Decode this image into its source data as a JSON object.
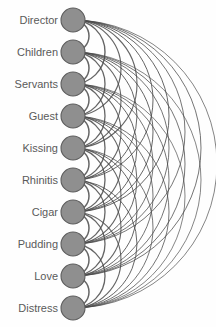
{
  "diagram": {
    "type": "arc-diagram",
    "title": "",
    "background_color": "#fefefe",
    "node_fill_color": "#8f8f8f",
    "node_stroke_color": "#5e5e5e",
    "edge_color": "#4a4a4a",
    "label_color": "#5a5a5a",
    "node_radius": 12,
    "node_center_x": 73,
    "first_node_y": 20,
    "node_spacing": 32,
    "label_right_x": 58,
    "arc_direction": "right",
    "graph_kind": "complete",
    "node_count": 10,
    "edge_count": 45,
    "nodes": [
      {
        "id": 0,
        "label": "Director"
      },
      {
        "id": 1,
        "label": "Children"
      },
      {
        "id": 2,
        "label": "Servants"
      },
      {
        "id": 3,
        "label": "Guest"
      },
      {
        "id": 4,
        "label": "Kissing"
      },
      {
        "id": 5,
        "label": "Rhinitis"
      },
      {
        "id": 6,
        "label": "Cigar"
      },
      {
        "id": 7,
        "label": "Pudding"
      },
      {
        "id": 8,
        "label": "Love"
      },
      {
        "id": 9,
        "label": "Distress"
      }
    ],
    "edges": [
      {
        "source": 0,
        "target": 1,
        "weight": 1.5
      },
      {
        "source": 0,
        "target": 2,
        "weight": 1.4
      },
      {
        "source": 0,
        "target": 3,
        "weight": 1.2
      },
      {
        "source": 0,
        "target": 4,
        "weight": 1.1
      },
      {
        "source": 0,
        "target": 5,
        "weight": 1.0
      },
      {
        "source": 0,
        "target": 6,
        "weight": 1.0
      },
      {
        "source": 0,
        "target": 7,
        "weight": 0.9
      },
      {
        "source": 0,
        "target": 8,
        "weight": 0.9
      },
      {
        "source": 0,
        "target": 9,
        "weight": 0.8
      },
      {
        "source": 1,
        "target": 2,
        "weight": 1.5
      },
      {
        "source": 1,
        "target": 3,
        "weight": 1.3
      },
      {
        "source": 1,
        "target": 4,
        "weight": 1.1
      },
      {
        "source": 1,
        "target": 5,
        "weight": 1.0
      },
      {
        "source": 1,
        "target": 6,
        "weight": 1.0
      },
      {
        "source": 1,
        "target": 7,
        "weight": 0.9
      },
      {
        "source": 1,
        "target": 8,
        "weight": 0.9
      },
      {
        "source": 1,
        "target": 9,
        "weight": 0.8
      },
      {
        "source": 2,
        "target": 3,
        "weight": 1.5
      },
      {
        "source": 2,
        "target": 4,
        "weight": 1.3
      },
      {
        "source": 2,
        "target": 5,
        "weight": 1.1
      },
      {
        "source": 2,
        "target": 6,
        "weight": 1.0
      },
      {
        "source": 2,
        "target": 7,
        "weight": 0.9
      },
      {
        "source": 2,
        "target": 8,
        "weight": 0.9
      },
      {
        "source": 2,
        "target": 9,
        "weight": 0.8
      },
      {
        "source": 3,
        "target": 4,
        "weight": 1.5
      },
      {
        "source": 3,
        "target": 5,
        "weight": 1.3
      },
      {
        "source": 3,
        "target": 6,
        "weight": 1.1
      },
      {
        "source": 3,
        "target": 7,
        "weight": 1.0
      },
      {
        "source": 3,
        "target": 8,
        "weight": 0.9
      },
      {
        "source": 3,
        "target": 9,
        "weight": 0.9
      },
      {
        "source": 4,
        "target": 5,
        "weight": 1.5
      },
      {
        "source": 4,
        "target": 6,
        "weight": 1.3
      },
      {
        "source": 4,
        "target": 7,
        "weight": 1.1
      },
      {
        "source": 4,
        "target": 8,
        "weight": 1.0
      },
      {
        "source": 4,
        "target": 9,
        "weight": 0.9
      },
      {
        "source": 5,
        "target": 6,
        "weight": 1.5
      },
      {
        "source": 5,
        "target": 7,
        "weight": 1.3
      },
      {
        "source": 5,
        "target": 8,
        "weight": 1.1
      },
      {
        "source": 5,
        "target": 9,
        "weight": 1.0
      },
      {
        "source": 6,
        "target": 7,
        "weight": 1.5
      },
      {
        "source": 6,
        "target": 8,
        "weight": 1.3
      },
      {
        "source": 6,
        "target": 9,
        "weight": 1.1
      },
      {
        "source": 7,
        "target": 8,
        "weight": 1.5
      },
      {
        "source": 7,
        "target": 9,
        "weight": 1.3
      },
      {
        "source": 8,
        "target": 9,
        "weight": 1.5
      }
    ]
  }
}
